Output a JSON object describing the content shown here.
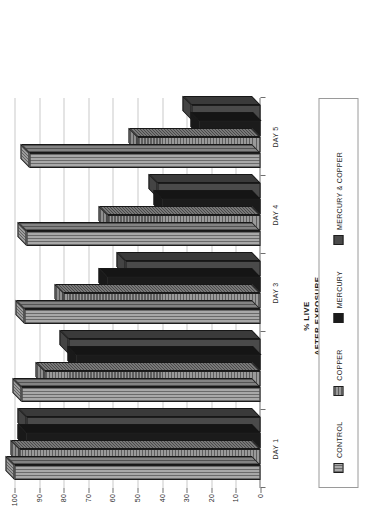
{
  "chart_data": {
    "type": "bar",
    "title": "",
    "subtitle": "",
    "xlabel": "",
    "ylabel": "% LIVE AFTER EXPOSURE",
    "ylabel_line1": "% LIVE",
    "ylabel_line2": "AFTER EXPOSURE",
    "orientation": "rotated-90-ccw",
    "style": "3d-bar",
    "grid": true,
    "legend_position": "bottom",
    "ylim": [
      0,
      100
    ],
    "yticks": [
      100,
      90,
      80,
      70,
      60,
      50,
      40,
      30,
      20,
      10,
      0
    ],
    "ytick_labels": [
      "100",
      "90",
      "80",
      "70",
      "60",
      "50",
      "40",
      "30",
      "20",
      "10",
      "0"
    ],
    "categories": [
      "DAY 1",
      "DAY 2",
      "DAY 3",
      "DAY 4",
      "DAY 5"
    ],
    "category_labels_shown": [
      "DAY 1",
      "",
      "DAY 3",
      "DAY 4",
      "DAY 5"
    ],
    "series": [
      {
        "name": "CONTROL",
        "color": "#a8a8a8",
        "pattern": "vertical-stripes",
        "values": [
          100,
          97,
          96,
          95,
          94
        ]
      },
      {
        "name": "COPPER",
        "color": "#9a9a9a",
        "pattern": "horizontal-stripes",
        "values": [
          98,
          88,
          80,
          62,
          50
        ]
      },
      {
        "name": "MERCURY",
        "color": "#1b1b1b",
        "pattern": "solid",
        "values": [
          95,
          75,
          62,
          40,
          25
        ]
      },
      {
        "name": "MERCURY & COPPER",
        "color": "#4a4a4a",
        "pattern": "solid",
        "values": [
          95,
          78,
          55,
          42,
          28
        ]
      }
    ]
  },
  "legend": {
    "items": [
      {
        "label": "CONTROL",
        "swatch_class": "sw-control"
      },
      {
        "label": "COPPER",
        "swatch_class": "sw-copper"
      },
      {
        "label": "MERCURY",
        "swatch_class": "sw-mercury"
      },
      {
        "label": "MERCURY & COPPER",
        "swatch_class": "sw-mercop"
      }
    ]
  }
}
